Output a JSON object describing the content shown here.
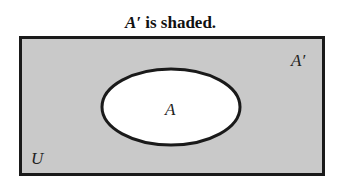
{
  "title": {
    "set_label": "A′",
    "text": " is shaded."
  },
  "diagram": {
    "universe_label": "U",
    "set_label": "A",
    "complement_label": "A′",
    "shaded_region": "complement",
    "colors": {
      "shade": "#c9c9c9",
      "set_fill": "#ffffff",
      "border": "#1a1a1a"
    }
  }
}
